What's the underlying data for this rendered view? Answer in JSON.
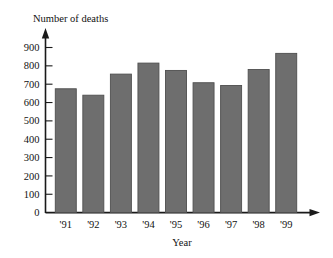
{
  "chart_data": {
    "type": "bar",
    "title": "",
    "ylabel": "Number of deaths",
    "xlabel": "Year",
    "categories": [
      "'91",
      "'92",
      "'93",
      "'94",
      "'95",
      "'96",
      "'97",
      "'98",
      "'99"
    ],
    "values": [
      675,
      640,
      755,
      815,
      775,
      708,
      693,
      780,
      868
    ],
    "series": [
      {
        "name": "Number of deaths",
        "values": [
          675,
          640,
          755,
          815,
          775,
          708,
          693,
          780,
          868
        ]
      }
    ],
    "ylim": [
      0,
      900
    ],
    "ytick_labels": [
      "0",
      "100",
      "200",
      "300",
      "400",
      "500",
      "600",
      "700",
      "800",
      "900"
    ],
    "ytick_values": [
      0,
      100,
      200,
      300,
      400,
      500,
      600,
      700,
      800,
      900
    ],
    "ytick_step": 100,
    "grid": false,
    "legend": "none",
    "bar_color": "#6e6e6e",
    "bar_edge_color": "#4f4f4f",
    "axis_color": "#1a1a1a",
    "background_color": "#ffffff",
    "axis_arrows": [
      "y-up",
      "x-right"
    ]
  }
}
